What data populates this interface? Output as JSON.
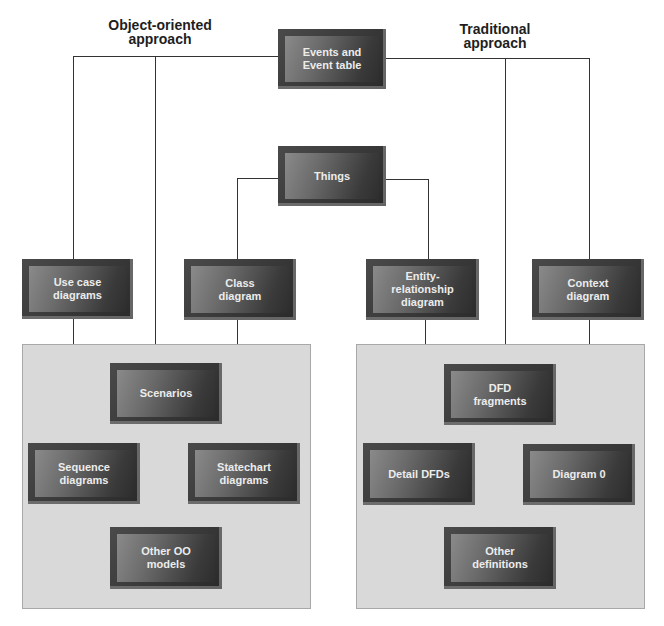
{
  "headings": {
    "left": "Object-oriented\napproach",
    "right": "Traditional\napproach"
  },
  "top_node": {
    "label": "Events and\nEvent table"
  },
  "middle_node": {
    "label": "Things"
  },
  "second_row": [
    {
      "label": "Use case\ndiagrams"
    },
    {
      "label": "Class\ndiagram"
    },
    {
      "label": "Entity-\nrelationship\ndiagram"
    },
    {
      "label": "Context\ndiagram"
    }
  ],
  "oo_panel": {
    "nodes": [
      {
        "label": "Scenarios"
      },
      {
        "label": "Sequence\ndiagrams"
      },
      {
        "label": "Statechart\ndiagrams"
      },
      {
        "label": "Other OO\nmodels"
      }
    ]
  },
  "traditional_panel": {
    "nodes": [
      {
        "label": "DFD\nfragments"
      },
      {
        "label": "Detail DFDs"
      },
      {
        "label": "Diagram 0"
      },
      {
        "label": "Other\ndefinitions"
      }
    ]
  },
  "colors": {
    "node_dark": "#2e2e2e",
    "node_light": "#8a8a8a",
    "panel_fill": "#d9d9d9",
    "line": "#333333",
    "node_text": "#ececec"
  }
}
